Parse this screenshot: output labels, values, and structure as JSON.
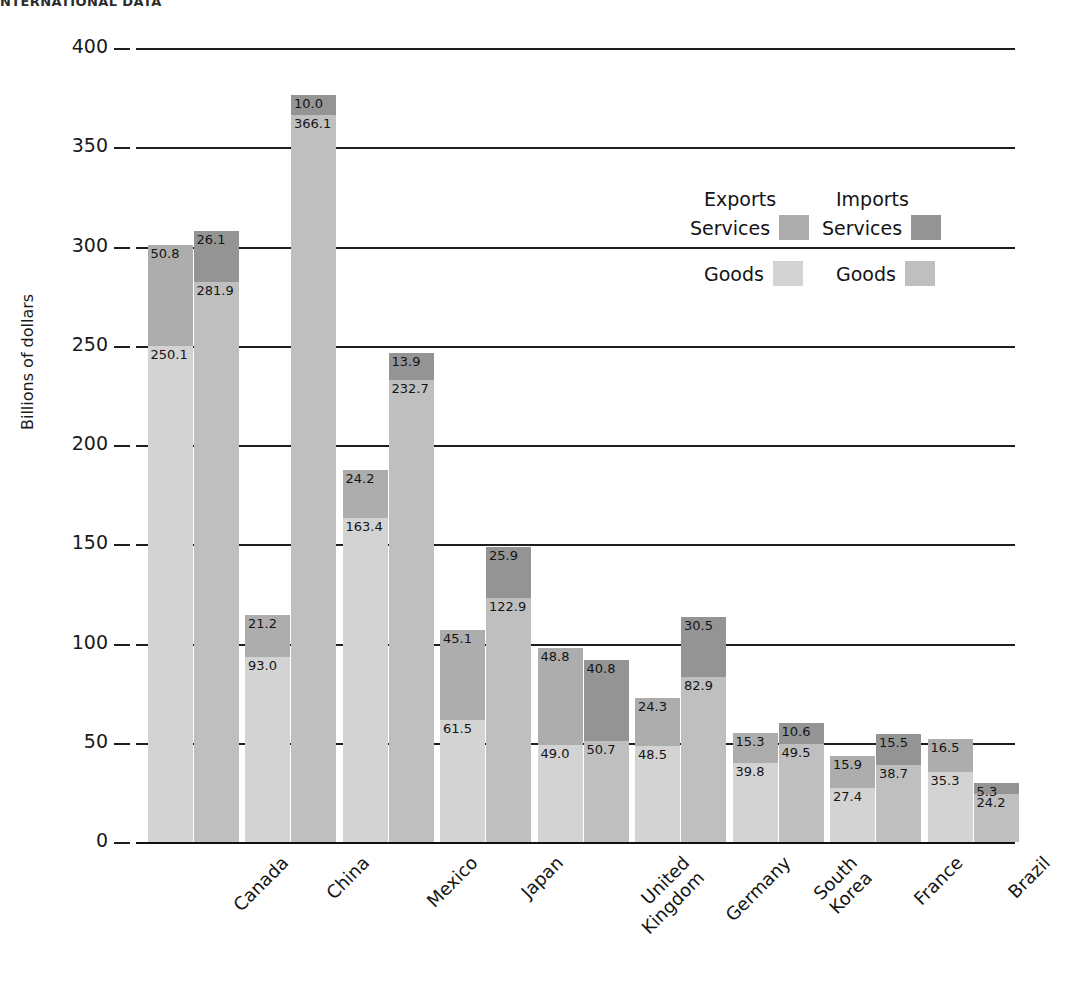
{
  "page_header": "NTERNATIONAL DATA",
  "chart_data": {
    "type": "bar",
    "subtype": "grouped-stacked",
    "title": "",
    "xlabel": "",
    "ylabel": "Billions of dollars",
    "ylim": [
      0,
      400
    ],
    "ytick_values": [
      0,
      50,
      100,
      150,
      200,
      250,
      300,
      350,
      400
    ],
    "ytick_labels": [
      "0",
      "50",
      "100",
      "150",
      "200",
      "250",
      "300",
      "350",
      "400"
    ],
    "grid": true,
    "grid_axis": "y",
    "legend_position": "upper-right-inside",
    "categories": [
      "Canada",
      "China",
      "Mexico",
      "Japan",
      "United\nKingdom",
      "Germany",
      "South\nKorea",
      "France",
      "Brazil"
    ],
    "series": [
      {
        "name": "Exports Goods",
        "group": "Exports",
        "stack_part": "Goods",
        "color": "#d3d3d3",
        "values": [
          250.1,
          93.0,
          163.4,
          61.5,
          49.0,
          48.5,
          39.8,
          27.4,
          35.3
        ]
      },
      {
        "name": "Exports Services",
        "group": "Exports",
        "stack_part": "Services",
        "color": "#adadad",
        "values": [
          50.8,
          21.2,
          24.2,
          45.1,
          48.8,
          24.3,
          15.3,
          15.9,
          16.5
        ]
      },
      {
        "name": "Imports Goods",
        "group": "Imports",
        "stack_part": "Goods",
        "color": "#bfbfbf",
        "values": [
          281.9,
          366.1,
          232.7,
          122.9,
          50.7,
          82.9,
          49.5,
          38.7,
          24.2
        ]
      },
      {
        "name": "Imports Services",
        "group": "Imports",
        "stack_part": "Services",
        "color": "#949494",
        "values": [
          26.1,
          10.0,
          13.9,
          25.9,
          40.8,
          30.5,
          10.6,
          15.5,
          5.3
        ]
      }
    ],
    "annotations": {
      "note": "Each country has two stacked bars: left = Exports (Goods bottom, Services top), right = Imports (Goods bottom, Services top). Values printed inside each segment."
    }
  },
  "legend": {
    "exports_head": "Exports",
    "imports_head": "Imports",
    "services_label_left": "Services",
    "services_label_right": "Services",
    "goods_label_left": "Goods",
    "goods_label_right": "Goods",
    "colors": {
      "exports_services": "#adadad",
      "imports_services": "#949494",
      "exports_goods": "#d3d3d3",
      "imports_goods": "#bfbfbf"
    }
  },
  "axis": {
    "y_title": "Billions of dollars"
  }
}
